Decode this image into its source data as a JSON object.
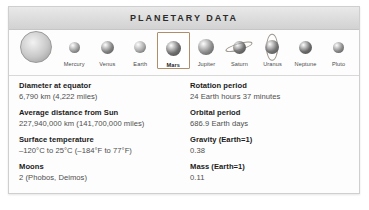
{
  "panel": {
    "title": "PLANETARY DATA"
  },
  "selector": {
    "bodies": [
      {
        "name": "",
        "icon": "sun-orb",
        "size": 30,
        "color": "#b9b9b9",
        "selected": false,
        "type": "sun"
      },
      {
        "name": "Mercury",
        "icon": "mercury-orb",
        "size": 11,
        "color": "#9a9a9a",
        "selected": false,
        "type": "planet"
      },
      {
        "name": "Venus",
        "icon": "venus-orb",
        "size": 13,
        "color": "#828282",
        "selected": false,
        "type": "planet"
      },
      {
        "name": "Earth",
        "icon": "earth-orb",
        "size": 12,
        "color": "#a8a8a8",
        "selected": false,
        "type": "planet"
      },
      {
        "name": "Mars",
        "icon": "mars-orb",
        "size": 15,
        "color": "#6f6f6f",
        "selected": true,
        "type": "planet"
      },
      {
        "name": "Jupiter",
        "icon": "jupiter-orb",
        "size": 16,
        "color": "#8d8d8d",
        "selected": false,
        "type": "planet"
      },
      {
        "name": "Saturn",
        "icon": "saturn-orb",
        "size": 13,
        "color": "#6e6e6e",
        "selected": false,
        "type": "ringed"
      },
      {
        "name": "Uranus",
        "icon": "uranus-orb",
        "size": 14,
        "color": "#757575",
        "selected": false,
        "type": "vring"
      },
      {
        "name": "Neptune",
        "icon": "neptune-orb",
        "size": 13,
        "color": "#6b6b6b",
        "selected": false,
        "type": "planet"
      },
      {
        "name": "Pluto",
        "icon": "pluto-orb",
        "size": 11,
        "color": "#8a8a8a",
        "selected": false,
        "type": "planet"
      }
    ]
  },
  "data": {
    "left": [
      {
        "label": "Diameter at equator",
        "value": "6,790 km (4,222 miles)"
      },
      {
        "label": "Average distance from Sun",
        "value": "227,940,000 km (141,700,000 miles)"
      },
      {
        "label": "Surface temperature",
        "value": "–120°C to 25°C (–184°F to 77°F)"
      },
      {
        "label": "Moons",
        "value": "2 (Phobos, Deimos)"
      }
    ],
    "right": [
      {
        "label": "Rotation period",
        "value": "24 Earth hours 37 minutes"
      },
      {
        "label": "Orbital period",
        "value": "686.9 Earth days"
      },
      {
        "label": "Gravity (Earth=1)",
        "value": "0.38"
      },
      {
        "label": "Mass (Earth=1)",
        "value": "0.11"
      }
    ]
  },
  "colors": {
    "header_text": "#2b2b2b",
    "selection_border": "#b08d6b",
    "label_text": "#1b1b1b",
    "value_text": "#4d4d4d"
  }
}
